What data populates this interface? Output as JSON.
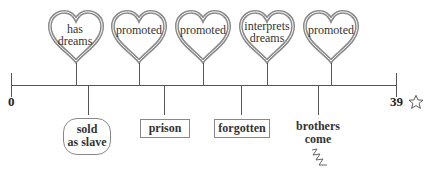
{
  "timeline": {
    "start_label": "0",
    "end_label": "39",
    "end_icon": "star-outline-icon",
    "axis_color": "#555555",
    "heart_color": "#8a8a8a"
  },
  "above_events": [
    {
      "label_line1": "has",
      "label_line2": "dreams"
    },
    {
      "label_line1": "promoted",
      "label_line2": ""
    },
    {
      "label_line1": "promoted",
      "label_line2": ""
    },
    {
      "label_line1": "interprets",
      "label_line2": "dreams"
    },
    {
      "label_line1": "promoted",
      "label_line2": ""
    }
  ],
  "below_events": [
    {
      "label_line1": "sold",
      "label_line2": "as slave",
      "shape": "rounded-box"
    },
    {
      "label_line1": "prison",
      "label_line2": "",
      "shape": "box"
    },
    {
      "label_line1": "forgotten",
      "label_line2": "",
      "shape": "box"
    },
    {
      "label_line1": "brothers",
      "label_line2": "come",
      "shape": "none",
      "icon": "zigzag-icon"
    }
  ]
}
